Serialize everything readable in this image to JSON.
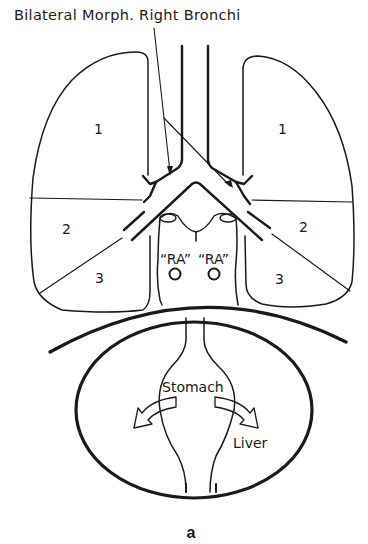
{
  "figure": {
    "title": "Bilateral Morph. Right Bronchi",
    "caption": "a",
    "colors": {
      "ink": "#1a1a1a",
      "background": "#ffffff"
    }
  },
  "lungs": {
    "left": {
      "lobes": [
        "1",
        "2",
        "3"
      ]
    },
    "right": {
      "lobes": [
        "1",
        "2",
        "3"
      ]
    }
  },
  "atria": {
    "left_label": "“RA”",
    "right_label": "“RA”"
  },
  "abdomen": {
    "stomach_label": "Stomach",
    "liver_label": "Liver"
  }
}
